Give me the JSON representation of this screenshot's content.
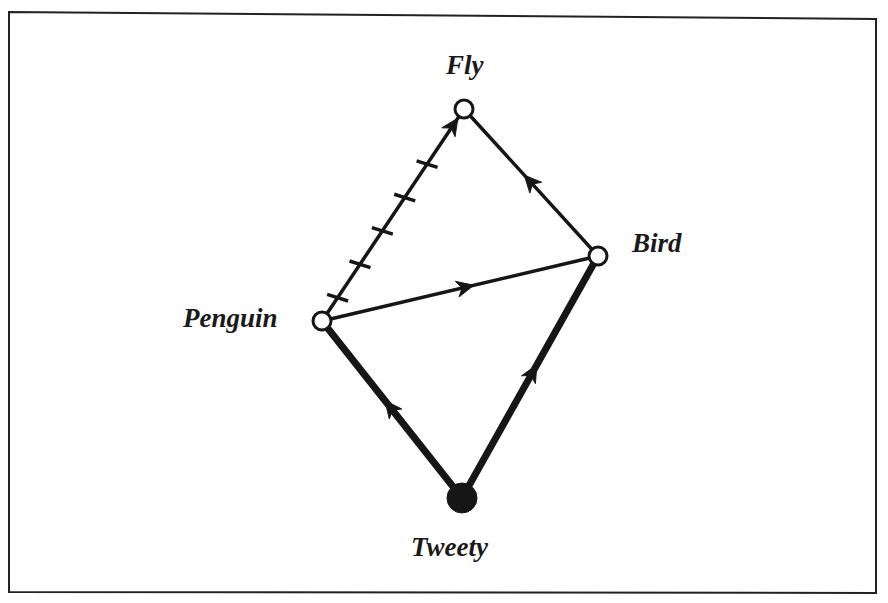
{
  "diagram": {
    "type": "inheritance-network",
    "frame": {
      "x1": 9,
      "y1": 11,
      "x2": 876,
      "y2": 593,
      "color": "#222222"
    },
    "colors": {
      "ink": "#161616",
      "background": "#ffffff"
    },
    "nodes": [
      {
        "id": "fly",
        "label": "Fly",
        "x": 464,
        "y": 109,
        "r": 9,
        "filled": false,
        "label_x": 446,
        "label_y": 52
      },
      {
        "id": "bird",
        "label": "Bird",
        "x": 598,
        "y": 256,
        "r": 9,
        "filled": false,
        "label_x": 632,
        "label_y": 230
      },
      {
        "id": "penguin",
        "label": "Penguin",
        "x": 322,
        "y": 321,
        "r": 9,
        "filled": false,
        "label_x": 183,
        "label_y": 305
      },
      {
        "id": "tweety",
        "label": "Tweety",
        "x": 462,
        "y": 498,
        "r": 15,
        "filled": true,
        "label_x": 411,
        "label_y": 534
      }
    ],
    "edges": [
      {
        "from": "penguin",
        "to": "fly",
        "kind": "negative",
        "thickness": 3.5,
        "arrow_t": 0.92,
        "ticks": 5
      },
      {
        "from": "bird",
        "to": "fly",
        "kind": "positive",
        "thickness": 3.5,
        "arrow_t": 0.55
      },
      {
        "from": "penguin",
        "to": "bird",
        "kind": "positive",
        "thickness": 3.5,
        "arrow_t": 0.55
      },
      {
        "from": "tweety",
        "to": "penguin",
        "kind": "strict",
        "thickness": 7,
        "arrow_t": 0.55
      },
      {
        "from": "tweety",
        "to": "bird",
        "kind": "strict",
        "thickness": 7,
        "arrow_t": 0.55
      }
    ]
  },
  "labels": {
    "fly": "Fly",
    "bird": "Bird",
    "penguin": "Penguin",
    "tweety": "Tweety"
  }
}
